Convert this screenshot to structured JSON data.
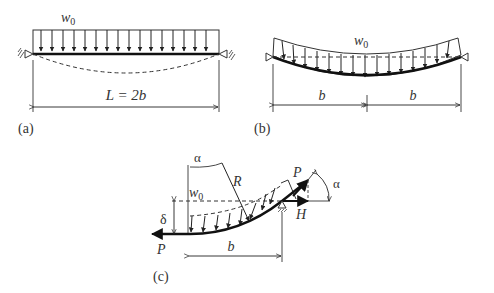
{
  "figure": {
    "panel_a": {
      "label": "(a)",
      "load": "w",
      "load_sub": "0",
      "dimension": "L = 2b"
    },
    "panel_b": {
      "label": "(b)",
      "load": "w",
      "load_sub": "0",
      "dim_left": "b",
      "dim_right": "b"
    },
    "panel_c": {
      "label": "(c)",
      "load": "w",
      "load_sub": "0",
      "angle_top": "α",
      "radius": "R",
      "deflection": "δ",
      "force_left": "P",
      "force_right": "P",
      "horizontal": "H",
      "angle_right": "α",
      "dimension": "b"
    }
  }
}
